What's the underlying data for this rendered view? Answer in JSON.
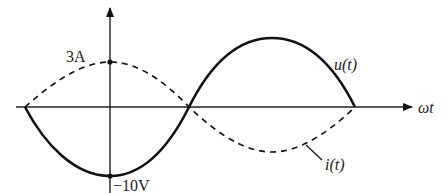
{
  "diagram": {
    "type": "sinusoidal-waveforms",
    "x_axis_label": "ωt",
    "labels": {
      "current_peak": "3A",
      "voltage_min": "−10V",
      "voltage_curve": "u(t)",
      "current_curve": "i(t)"
    },
    "curves": [
      {
        "name": "u(t)",
        "style": "solid",
        "amplitude": "10V",
        "phase_note": "starts at 0 going negative (−sin)"
      },
      {
        "name": "i(t)",
        "style": "dashed",
        "amplitude": "3A",
        "phase_note": "peak at origin (cos)"
      }
    ],
    "colors": {
      "stroke": "#111111",
      "background": "#ffffff"
    }
  }
}
